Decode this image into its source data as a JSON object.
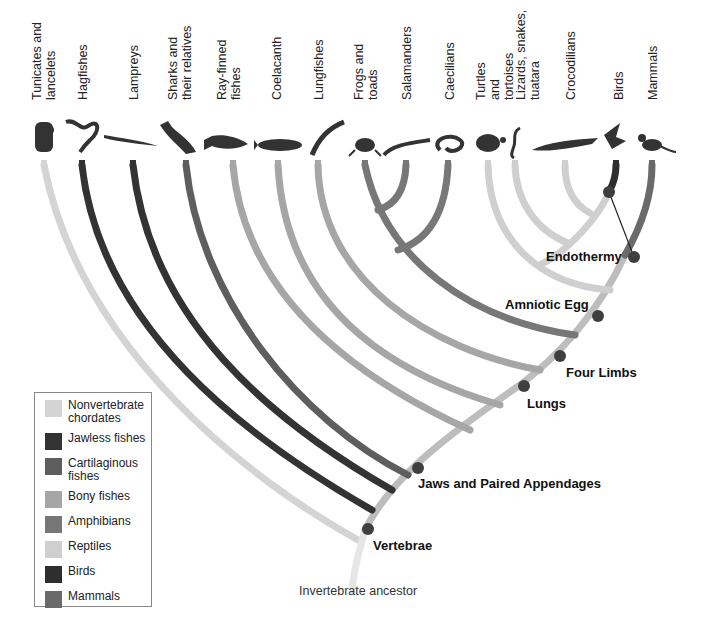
{
  "taxa": [
    {
      "label": "Tunicates and lancelets",
      "group": "Nonvertebrate chordates",
      "icon": "tunicate-icon"
    },
    {
      "label": "Hagfishes",
      "group": "Jawless fishes",
      "icon": "hagfish-icon"
    },
    {
      "label": "Lampreys",
      "group": "Jawless fishes",
      "icon": "lamprey-icon"
    },
    {
      "label": "Sharks and their relatives",
      "group": "Cartilaginous fishes",
      "icon": "shark-icon"
    },
    {
      "label": "Ray-finned fishes",
      "group": "Bony fishes",
      "icon": "ray-finned-fish-icon"
    },
    {
      "label": "Coelacanth",
      "group": "Bony fishes",
      "icon": "coelacanth-icon"
    },
    {
      "label": "Lungfishes",
      "group": "Bony fishes",
      "icon": "lungfish-icon"
    },
    {
      "label": "Frogs and toads",
      "group": "Amphibians",
      "icon": "frog-icon"
    },
    {
      "label": "Salamanders",
      "group": "Amphibians",
      "icon": "salamander-icon"
    },
    {
      "label": "Caecilians",
      "group": "Amphibians",
      "icon": "caecilian-icon"
    },
    {
      "label": "Turtles and tortoises",
      "group": "Reptiles",
      "icon": "turtle-icon"
    },
    {
      "label": "Lizards, snakes, tuatara",
      "group": "Reptiles",
      "icon": "snake-icon"
    },
    {
      "label": "Crocodilians",
      "group": "Reptiles",
      "icon": "crocodile-icon"
    },
    {
      "label": "Birds",
      "group": "Birds",
      "icon": "bird-icon"
    },
    {
      "label": "Mammals",
      "group": "Mammals",
      "icon": "monkey-icon"
    }
  ],
  "traits": [
    {
      "label": "Vertebrae"
    },
    {
      "label": "Jaws and Paired Appendages"
    },
    {
      "label": "Lungs"
    },
    {
      "label": "Four Limbs"
    },
    {
      "label": "Amniotic Egg"
    },
    {
      "label": "Endothermy"
    }
  ],
  "root_label": "Invertebrate ancestor",
  "legend": [
    {
      "label": "Nonvertebrate chordates",
      "color": "#d4d4d4"
    },
    {
      "label": "Jawless fishes",
      "color": "#333333"
    },
    {
      "label": "Cartilaginous fishes",
      "color": "#5e5e5e"
    },
    {
      "label": "Bony fishes",
      "color": "#a6a6a6"
    },
    {
      "label": "Amphibians",
      "color": "#777777"
    },
    {
      "label": "Reptiles",
      "color": "#cfcfcf"
    },
    {
      "label": "Birds",
      "color": "#2e2e2e"
    },
    {
      "label": "Mammals",
      "color": "#6a6a6a"
    }
  ],
  "colors": {
    "node": "#3f3f3f",
    "background": "#ffffff"
  }
}
